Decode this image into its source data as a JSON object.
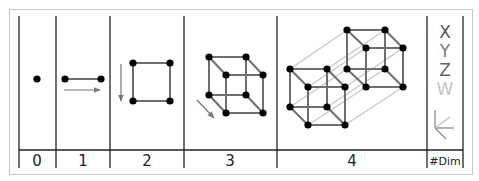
{
  "columns": [
    {
      "label": "0",
      "shape": "point"
    },
    {
      "label": "1",
      "shape": "line segment"
    },
    {
      "label": "2",
      "shape": "square"
    },
    {
      "label": "3",
      "shape": "cube"
    },
    {
      "label": "4",
      "shape": "tesseract"
    },
    {
      "label": "#Dim",
      "shape": "axes legend"
    }
  ],
  "axes": [
    {
      "label": "X",
      "color": "#555555"
    },
    {
      "label": "Y",
      "color": "#777777"
    },
    {
      "label": "Z",
      "color": "#666666"
    },
    {
      "label": "W",
      "color": "#c4c4c4"
    }
  ],
  "colors": {
    "line": "#222222",
    "edge": "#6e6e6e",
    "projection_edge": "#c8c8c8",
    "arrow": "#777777",
    "vertex": "#000000",
    "border": "#c8c8c8"
  }
}
